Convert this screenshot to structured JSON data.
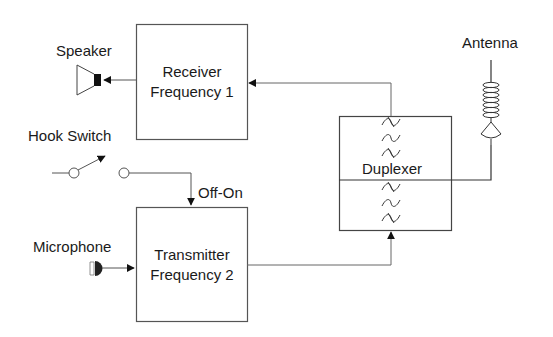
{
  "diagram": {
    "type": "block-diagram",
    "colors": {
      "line": "#555555",
      "stroke_dark": "#222222",
      "background": "#ffffff"
    },
    "labels": {
      "speaker": "Speaker",
      "hook_switch": "Hook Switch",
      "microphone": "Microphone",
      "antenna": "Antenna",
      "off_on": "Off-On",
      "duplexer": "Duplexer"
    },
    "blocks": {
      "receiver": {
        "line1": "Receiver",
        "line2": "Frequency 1"
      },
      "transmitter": {
        "line1": "Transmitter",
        "line2": "Frequency 2"
      },
      "duplexer": {
        "label": "Duplexer",
        "filter_symbols_per_half": 3
      }
    },
    "connections": [
      {
        "from": "duplexer",
        "to": "receiver"
      },
      {
        "from": "receiver",
        "to": "speaker"
      },
      {
        "from": "hook_switch",
        "to": "transmitter",
        "label": "Off-On"
      },
      {
        "from": "microphone",
        "to": "transmitter"
      },
      {
        "from": "transmitter",
        "to": "duplexer"
      },
      {
        "from": "antenna",
        "to": "duplexer"
      }
    ],
    "icons": [
      "speaker-icon",
      "switch-icon",
      "microphone-icon",
      "antenna-icon",
      "bandpass-filter-icon"
    ]
  }
}
